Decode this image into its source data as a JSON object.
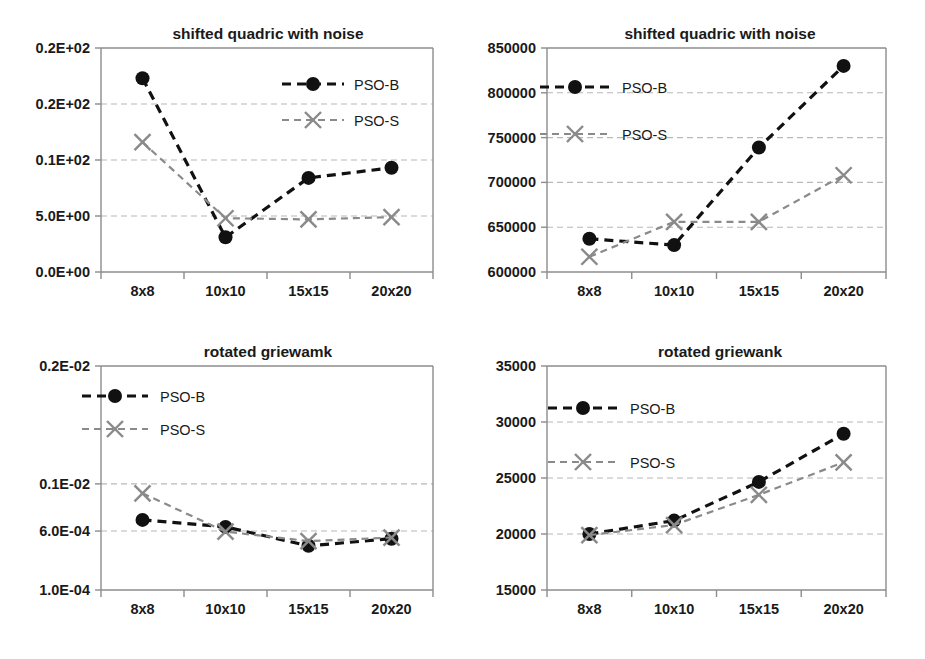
{
  "figure": {
    "panel_count": 4,
    "background": "#ffffff"
  },
  "series_styles": {
    "pso_b": {
      "name": "PSO-B",
      "color": "#111111",
      "marker": "circle"
    },
    "pso_s": {
      "name": "PSO-S",
      "color": "#8a8a8a",
      "marker": "x"
    }
  },
  "chart_data": [
    {
      "id": "top-left",
      "type": "line",
      "title": "shifted quadric with noise",
      "xlabel": "",
      "ylabel": "",
      "categories": [
        "8x8",
        "10x10",
        "15x15",
        "20x20"
      ],
      "ytick_labels": [
        "0.2E+02",
        "0.2E+02",
        "0.1E+02",
        "5.0E+00",
        "0.0E+00"
      ],
      "ytick_values": [
        20,
        15,
        10,
        5,
        0
      ],
      "ylim": [
        0,
        20
      ],
      "grid": true,
      "legend_position": "top-right",
      "series": [
        {
          "name": "PSO-B",
          "values": [
            17.3,
            3.1,
            8.4,
            9.3
          ]
        },
        {
          "name": "PSO-S",
          "values": [
            11.6,
            4.8,
            4.7,
            4.9
          ]
        }
      ]
    },
    {
      "id": "top-right",
      "type": "line",
      "title": "shifted quadric with noise",
      "xlabel": "",
      "ylabel": "",
      "categories": [
        "8x8",
        "10x10",
        "15x15",
        "20x20"
      ],
      "ytick_labels": [
        "850000",
        "800000",
        "750000",
        "700000",
        "650000",
        "600000"
      ],
      "ytick_values": [
        850000,
        800000,
        750000,
        700000,
        650000,
        600000
      ],
      "ylim": [
        600000,
        850000
      ],
      "grid": true,
      "legend_position": "top-left",
      "series": [
        {
          "name": "PSO-B",
          "values": [
            637000,
            630000,
            739000,
            830000
          ]
        },
        {
          "name": "PSO-S",
          "values": [
            617000,
            656000,
            656000,
            708000
          ]
        }
      ]
    },
    {
      "id": "bottom-left",
      "type": "line",
      "title": "rotated griewamk",
      "xlabel": "",
      "ylabel": "",
      "categories": [
        "8x8",
        "10x10",
        "15x15",
        "20x20"
      ],
      "ytick_labels": [
        "0.2E-02",
        "0.1E-02",
        "6.0E-04",
        "1.0E-04"
      ],
      "ytick_values": [
        0.002,
        0.001,
        0.0006,
        0.0001
      ],
      "ylim": [
        0.0001,
        0.002
      ],
      "grid": true,
      "legend_position": "top-left",
      "series": [
        {
          "name": "PSO-B",
          "values": [
            0.000695,
            0.000635,
            0.000475,
            0.000535
          ]
        },
        {
          "name": "PSO-S",
          "values": [
            0.00092,
            0.000595,
            0.000515,
            0.000545
          ]
        }
      ]
    },
    {
      "id": "bottom-right",
      "type": "line",
      "title": "rotated griewank",
      "xlabel": "",
      "ylabel": "",
      "categories": [
        "8x8",
        "10x10",
        "15x15",
        "20x20"
      ],
      "ytick_labels": [
        "35000",
        "30000",
        "25000",
        "20000",
        "15000"
      ],
      "ytick_values": [
        35000,
        30000,
        25000,
        20000,
        15000
      ],
      "ylim": [
        15000,
        35000
      ],
      "grid": true,
      "legend_position": "top-left",
      "series": [
        {
          "name": "PSO-B",
          "values": [
            20000,
            21200,
            24650,
            28950
          ]
        },
        {
          "name": "PSO-S",
          "values": [
            19900,
            20800,
            23500,
            26400
          ]
        }
      ]
    }
  ]
}
